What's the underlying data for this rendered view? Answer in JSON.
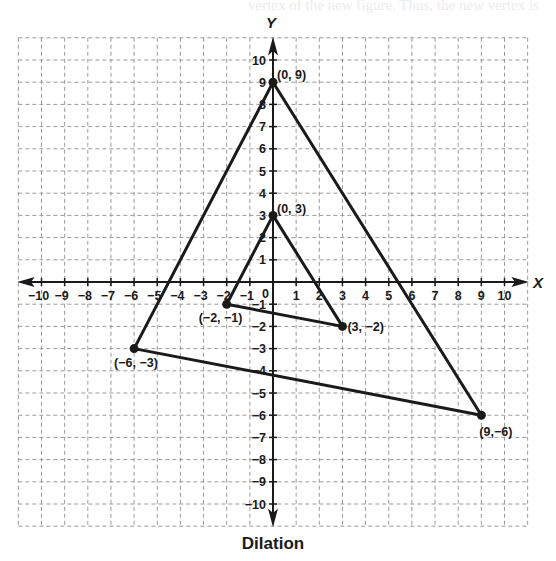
{
  "caption": "Dilation",
  "bleed_text": "vertex of the new figure. Thus, the new vertex is",
  "chart_data": {
    "type": "diagram",
    "title": "Dilation",
    "xlabel": "X",
    "ylabel": "Y",
    "xlim": [
      -10,
      10
    ],
    "ylim": [
      -10,
      10
    ],
    "grid": true,
    "x_ticks": [
      -10,
      -9,
      -8,
      -7,
      -6,
      -5,
      -4,
      -3,
      -2,
      -1,
      1,
      2,
      3,
      4,
      5,
      6,
      7,
      8,
      9,
      10
    ],
    "y_ticks": [
      -10,
      -9,
      -8,
      -7,
      -6,
      -5,
      -4,
      -3,
      -2,
      -1,
      1,
      2,
      3,
      4,
      5,
      6,
      7,
      8,
      9,
      10
    ],
    "origin_label": "0",
    "shapes": [
      {
        "name": "Original triangle",
        "vertices": [
          {
            "x": 0,
            "y": 3,
            "label": "(0, 3)"
          },
          {
            "x": -2,
            "y": -1,
            "label": "(−2, −1)"
          },
          {
            "x": 3,
            "y": -2,
            "label": "(3, −2)"
          }
        ]
      },
      {
        "name": "Dilated triangle (scale factor 3)",
        "vertices": [
          {
            "x": 0,
            "y": 9,
            "label": "(0, 9)"
          },
          {
            "x": -6,
            "y": -3,
            "label": "(−6, −3)"
          },
          {
            "x": 9,
            "y": -6,
            "label": "(9,−6)"
          }
        ]
      }
    ]
  }
}
